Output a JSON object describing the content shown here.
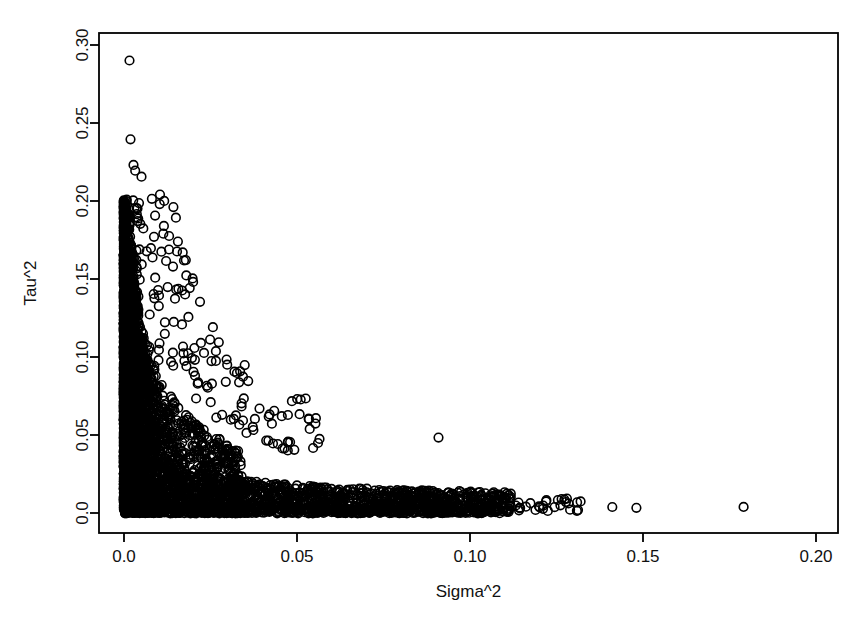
{
  "figure": {
    "background_color": "#ffffff",
    "foreground_color": "#000000",
    "point_style": "open-circle",
    "point_radius_px": 4.3,
    "point_stroke_width_px": 1.6
  },
  "axes": {
    "frame": {
      "left_px": 99,
      "top_px": 33,
      "right_px": 838,
      "bottom_px": 533
    },
    "x": {
      "label": "Sigma^2",
      "ticks": [
        0,
        0.05,
        0.1,
        0.15,
        0.2
      ],
      "tick_labels": [
        "0.0",
        "0.05",
        "0.10",
        "0.15",
        "0.20"
      ],
      "tick_px": [
        124,
        297,
        470,
        643,
        816
      ],
      "range": [
        -0.0072,
        0.2135
      ]
    },
    "y": {
      "label": "Tau^2",
      "ticks": [
        0,
        0.05,
        0.1,
        0.15,
        0.2,
        0.25,
        0.3
      ],
      "tick_labels": [
        "0.0",
        "0.05",
        "0.10",
        "0.15",
        "0.20",
        "0.25",
        "0.30"
      ],
      "tick_px": [
        513,
        435,
        357,
        279,
        201,
        123,
        45
      ],
      "range": [
        -0.0128,
        0.3128
      ]
    }
  },
  "chart_data": {
    "type": "scatter",
    "title": "",
    "xlabel": "Sigma^2",
    "ylabel": "Tau^2",
    "xlim": [
      -0.0072,
      0.2135
    ],
    "ylim": [
      -0.0128,
      0.3128
    ],
    "grid": false,
    "legend": null,
    "marker": "open circle",
    "color": "#000000",
    "n_points_approx": 4200,
    "notable_points": [
      {
        "x": 0.0019,
        "y": 0.2949,
        "note": "topmost outlier"
      },
      {
        "x": 0.0022,
        "y": 0.2436
      },
      {
        "x": 0.0031,
        "y": 0.2269
      },
      {
        "x": 0.0036,
        "y": 0.2231
      },
      {
        "x": 0.0055,
        "y": 0.2192
      },
      {
        "x": 0.003,
        "y": 0.2038
      },
      {
        "x": 0.0034,
        "y": 0.1987
      },
      {
        "x": 0.0041,
        "y": 0.1949
      },
      {
        "x": 0.012,
        "y": 0.1821,
        "note": "right-shifted high point"
      },
      {
        "x": 0.0024,
        "y": 0.1744
      },
      {
        "x": 0.0165,
        "y": 0.1462,
        "note": "isolated mid-high outlier"
      },
      {
        "x": 0.0213,
        "y": 0.1077,
        "note": "isolated outlier"
      },
      {
        "x": 0.0434,
        "y": 0.0474,
        "note": "isolated mid-plot outlier"
      },
      {
        "x": 0.0942,
        "y": 0.0493,
        "note": "isolated right outlier above the tail"
      },
      {
        "x": 0.1242,
        "y": 0.0045,
        "note": "tail point"
      },
      {
        "x": 0.1318,
        "y": 0.009,
        "note": "tail point"
      },
      {
        "x": 0.133,
        "y": 0.0064,
        "note": "tail point"
      },
      {
        "x": 0.1461,
        "y": 0.0041,
        "note": "tail point"
      },
      {
        "x": 0.1533,
        "y": 0.0036,
        "note": "tail point"
      },
      {
        "x": 0.1853,
        "y": 0.0042,
        "note": "rightmost point"
      }
    ],
    "structure": {
      "vertical_branch": {
        "x_range": [
          0.0002,
          0.009
        ],
        "y_range": [
          0.0,
          0.2
        ],
        "density": "saturated"
      },
      "horizontal_branch": {
        "x_range": [
          0.0,
          0.12
        ],
        "y_range": [
          0.0,
          0.012
        ],
        "density": "saturated"
      },
      "sparse_tail": {
        "x_range": [
          0.12,
          0.19
        ],
        "y_range": [
          0.002,
          0.01
        ],
        "density": "isolated"
      }
    }
  }
}
